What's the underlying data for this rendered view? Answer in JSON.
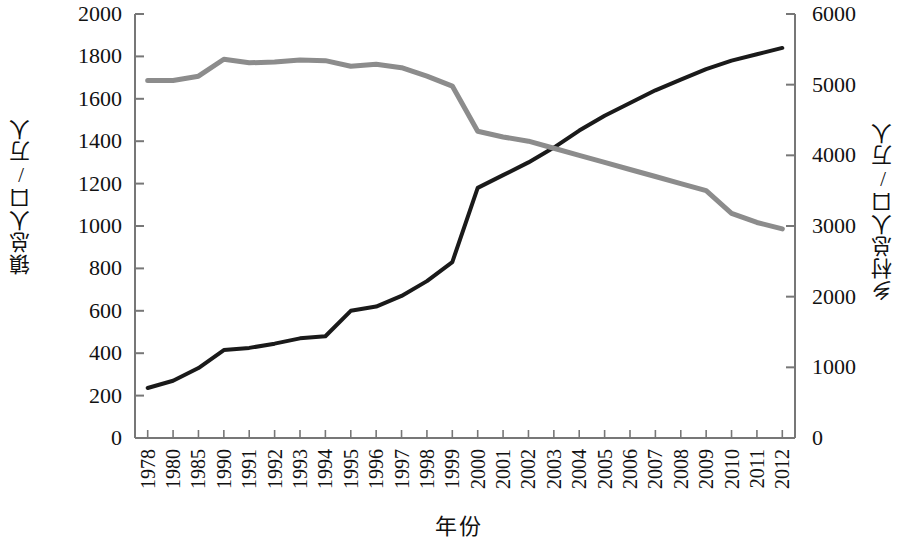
{
  "chart_data": {
    "type": "line",
    "title": "",
    "xlabel": "年份",
    "ylabel": "镇总人口/万人",
    "y2label": "乡村总人口/万人",
    "grid": false,
    "legend": "none",
    "categories": [
      "1978",
      "1980",
      "1985",
      "1990",
      "1991",
      "1992",
      "1993",
      "1994",
      "1995",
      "1996",
      "1997",
      "1998",
      "1999",
      "2000",
      "2001",
      "2002",
      "2003",
      "2004",
      "2005",
      "2006",
      "2007",
      "2008",
      "2009",
      "2010",
      "2011",
      "2012"
    ],
    "ylim": [
      0,
      2000
    ],
    "yticks": [
      0,
      200,
      400,
      600,
      800,
      1000,
      1200,
      1400,
      1600,
      1800,
      2000
    ],
    "y2lim": [
      0,
      6000
    ],
    "y2ticks": [
      0,
      1000,
      2000,
      3000,
      4000,
      5000,
      6000
    ],
    "series": [
      {
        "name": "镇总人口/万人",
        "axis": "left",
        "color": "#1a1a1a",
        "values": [
          236,
          270,
          330,
          415,
          425,
          445,
          470,
          480,
          600,
          620,
          670,
          740,
          830,
          1180,
          1240,
          1300,
          1370,
          1450,
          1520,
          1580,
          1640,
          1690,
          1740,
          1780,
          1810,
          1840
        ]
      },
      {
        "name": "乡村总人口/万人",
        "axis": "right",
        "color": "#8c8c8c",
        "values": [
          5060,
          5060,
          5120,
          5360,
          5310,
          5320,
          5350,
          5340,
          5260,
          5290,
          5240,
          5120,
          4980,
          4340,
          4260,
          4200,
          4100,
          4000,
          3900,
          3800,
          3700,
          3600,
          3500,
          3180,
          3050,
          2960
        ]
      }
    ]
  },
  "axes": {
    "left_title": "镇总人口/万人",
    "right_title": "乡村总人口/万人",
    "x_title": "年份"
  }
}
